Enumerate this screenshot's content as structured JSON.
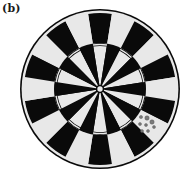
{
  "figure": {
    "panel_label": "(b)"
  },
  "board": {
    "center": [
      100,
      89
    ],
    "outer_radius": 80,
    "segments": 20,
    "colors": {
      "dark": "#0a0a0a",
      "light": "#e8e8e8",
      "rim": "#0a0a0a",
      "marks": "#7a7a7a",
      "background": "#ffffff"
    },
    "rings": [
      {
        "name": "outer-rim",
        "radius": 80
      },
      {
        "name": "outer-field",
        "radius": 76
      },
      {
        "name": "middle-ring",
        "radius": 46
      },
      {
        "name": "inner-field",
        "radius": 43
      },
      {
        "name": "bullseye",
        "radius": 4
      }
    ]
  },
  "dart_marks": [
    {
      "x": 141,
      "y": 117,
      "r": 1.6
    },
    {
      "x": 147,
      "y": 118,
      "r": 2.2
    },
    {
      "x": 152,
      "y": 122,
      "r": 2.2
    },
    {
      "x": 140,
      "y": 124,
      "r": 1.5
    },
    {
      "x": 146,
      "y": 125,
      "r": 1.5
    },
    {
      "x": 154,
      "y": 127,
      "r": 1.5
    },
    {
      "x": 142,
      "y": 131,
      "r": 1.5
    },
    {
      "x": 148,
      "y": 131,
      "r": 1.5
    }
  ]
}
